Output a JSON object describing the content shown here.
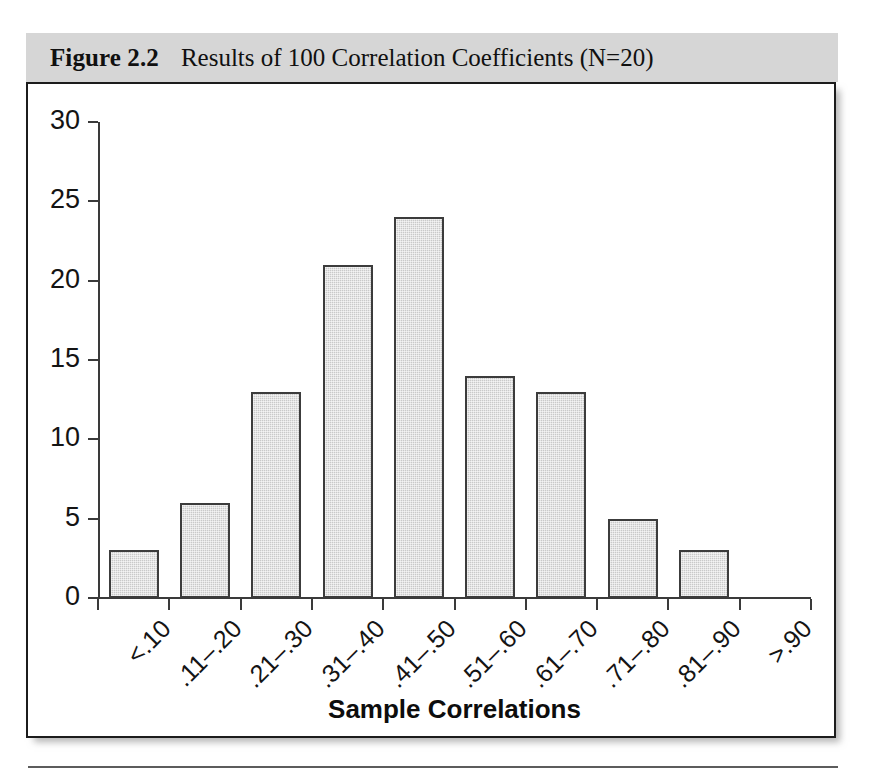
{
  "figure": {
    "caption_label": "Figure 2.2",
    "caption_text": "Results of 100 Correlation Coefficients (N=20)"
  },
  "chart_data": {
    "type": "bar",
    "title": "Results of 100 Correlation Coefficients (N=20)",
    "xlabel": "Sample Correlations",
    "ylabel": "",
    "categories": [
      "<.10",
      ".11–.20",
      ".21–.30",
      ".31–.40",
      ".41–.50",
      ".51–.60",
      ".61–.70",
      ".71–.80",
      ".81–.90",
      ">.90"
    ],
    "values": [
      3,
      6,
      13,
      21,
      24,
      14,
      13,
      5,
      3,
      0
    ],
    "ylim": [
      0,
      30
    ],
    "yticks": [
      0,
      5,
      10,
      15,
      20,
      25,
      30
    ],
    "ytick_labels": [
      "0",
      "5",
      "10",
      "15",
      "20",
      "25",
      "30"
    ],
    "grid": false,
    "legend": null,
    "bar_fill_color": "#c9c9c9",
    "bar_edge_color": "#3c3c3c",
    "axis_color": "#3a3a3a",
    "caption_band_color": "#d6d6d6",
    "total_count": 100
  }
}
